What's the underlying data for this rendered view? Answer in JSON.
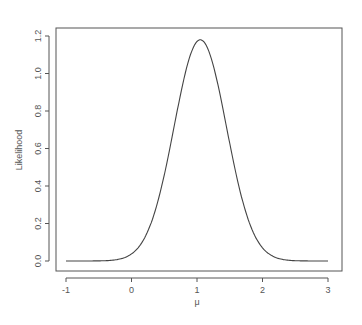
{
  "chart_data": {
    "type": "line",
    "title": "",
    "xlabel": "μ",
    "ylabel": "Likelihood",
    "xlim": [
      -1,
      3
    ],
    "ylim": [
      0,
      1.2
    ],
    "xticks": [
      -1,
      0,
      1,
      2,
      3
    ],
    "xtick_labels": [
      "-1",
      "0",
      "1",
      "2",
      "3"
    ],
    "yticks": [
      0.0,
      0.2,
      0.4,
      0.6,
      0.8,
      1.0,
      1.2
    ],
    "ytick_labels": [
      "0.0",
      "0.2",
      "0.4",
      "0.6",
      "0.8",
      "1.0",
      "1.2"
    ],
    "grid": false,
    "legend": null,
    "series": [
      {
        "name": "Likelihood",
        "x": [
          -1.0,
          -0.5,
          0.0,
          0.25,
          0.5,
          0.75,
          0.9,
          1.05,
          1.2,
          1.35,
          1.6,
          1.85,
          2.1,
          2.5,
          3.0
        ],
        "values": [
          0.0,
          0.0,
          0.04,
          0.16,
          0.45,
          0.88,
          1.09,
          1.18,
          1.09,
          0.88,
          0.45,
          0.16,
          0.04,
          0.0,
          0.0
        ],
        "peak": {
          "x": 1.05,
          "y": 1.18
        },
        "approx_sd": 0.4
      }
    ],
    "color": "#444444"
  }
}
